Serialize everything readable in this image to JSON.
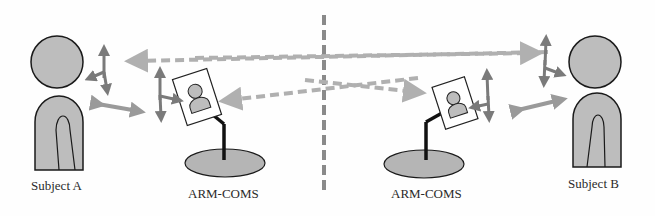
{
  "diagram": {
    "labels": {
      "subject_a": "Subject A",
      "subject_b": "Subject B",
      "device_left": "ARM-COMS",
      "device_right": "ARM-COMS"
    },
    "colors": {
      "figure_fill": "#bdbdbd",
      "outline": "#1a1a1a",
      "arrow_light": "#b0b0b0",
      "arrow_dark": "#7a7a7a",
      "divider": "#8a8a8a",
      "base_fill": "#b5b5b5"
    }
  }
}
